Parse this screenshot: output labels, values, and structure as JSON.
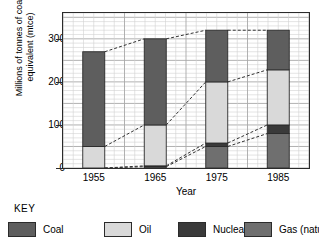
{
  "chart_data": {
    "type": "bar",
    "subtype": "stacked-bar-with-trend-lines",
    "title": "",
    "xlabel": "Year",
    "ylabel": "Millions of tonnes of coal equivalent (mtce)",
    "categories": [
      "1955",
      "1965",
      "1975",
      "1985"
    ],
    "ylim": [
      0,
      360
    ],
    "yticks": [
      0,
      100,
      200,
      300
    ],
    "ytick_labels": [
      "0",
      "100",
      "200",
      "300"
    ],
    "grid": true,
    "grid_minor_step": 10,
    "grid_major_step": 50,
    "legend_position": "below",
    "stack_order_bottom_to_top": [
      "Gas (natural)",
      "Nuclear",
      "Oil",
      "Coal"
    ],
    "series": [
      {
        "name": "Gas (natural)",
        "color": "#6f6f6f",
        "values": [
          0,
          3,
          50,
          80
        ]
      },
      {
        "name": "Nuclear",
        "color": "#3a3a3a",
        "values": [
          0,
          2,
          8,
          20
        ]
      },
      {
        "name": "Oil",
        "color": "#d9d9d9",
        "values": [
          50,
          95,
          142,
          128
        ]
      },
      {
        "name": "Coal",
        "color": "#5e5e5e",
        "values": [
          220,
          200,
          120,
          92
        ]
      }
    ],
    "cumulative_tops": {
      "Gas (natural)": [
        0,
        3,
        50,
        80
      ],
      "Nuclear": [
        0,
        5,
        58,
        100
      ],
      "Oil": [
        50,
        100,
        200,
        228
      ],
      "Coal": [
        270,
        300,
        320,
        320
      ]
    },
    "totals": [
      270,
      300,
      320,
      320
    ],
    "trend_lines": [
      {
        "name": "total-top-trend",
        "values": [
          270,
          300,
          320,
          320
        ],
        "style": "dashed"
      },
      {
        "name": "oil-top-trend",
        "values": [
          50,
          100,
          200,
          228
        ],
        "style": "dashed"
      },
      {
        "name": "nuclear-top-trend",
        "values": [
          0,
          5,
          58,
          100
        ],
        "style": "dashed"
      },
      {
        "name": "gas-top-trend",
        "values": [
          0,
          3,
          50,
          80
        ],
        "style": "dashed"
      }
    ]
  },
  "axis": {
    "y_title_line1": "Millions of tonnes of coal",
    "y_title_line2": "equivalent (mtce)",
    "x_title": "Year"
  },
  "legend": {
    "key_label": "KEY",
    "items": [
      {
        "label": "Coal",
        "color": "#5e5e5e"
      },
      {
        "label": "Oil",
        "color": "#d9d9d9"
      },
      {
        "label": "Nuclear",
        "color": "#3a3a3a"
      },
      {
        "label": "Gas (natural)",
        "color": "#6f6f6f"
      }
    ]
  },
  "colors": {
    "axis": "#2b2b2b",
    "grid_minor": "#d2d2d2",
    "grid_major": "#a8a8a8",
    "background": "#ffffff",
    "bar_border": "#2b2b2b",
    "trend_line": "#333333"
  }
}
